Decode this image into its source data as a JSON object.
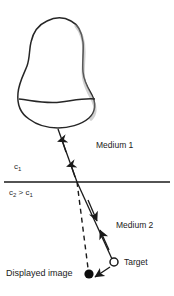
{
  "figure": {
    "background_color": "#ffffff",
    "stroke_color": "#1a1a1a",
    "width": 174,
    "height": 296
  },
  "labels": {
    "medium1": "Medium 1",
    "medium2": "Medium 2",
    "c1": "c",
    "c1_sub": "1",
    "c2_gt_c1_a": "c",
    "c2_sub": "2",
    "c2_gt_c1_op": " > c",
    "c1_sub_b": "1",
    "target": "Target",
    "displayed_image": "Displayed image"
  },
  "elements": {
    "transducer": {
      "name": "ultrasound-transducer",
      "footprint_line_y": 101
    },
    "interface": {
      "name": "medium-boundary",
      "y": 182,
      "x_start": 4,
      "x_end": 170
    },
    "target_marker": {
      "name": "target-point",
      "style": "open-circle",
      "cx": 114,
      "cy": 262,
      "r": 4
    },
    "displayed_marker": {
      "name": "displayed-image-point",
      "style": "filled-circle",
      "cx": 89,
      "cy": 274,
      "r": 4.5
    },
    "incident_ray": {
      "name": "incident-ray-medium-1",
      "description": "solid line from transducer to interface with upward arrowheads"
    },
    "refracted_ray": {
      "name": "refracted-ray-medium-2",
      "description": "solid line bending at interface down to target with arrowheads"
    },
    "apparent_path": {
      "name": "apparent-path-dashed",
      "description": "dashed straight continuation from interface to displayed image"
    },
    "displacement_arrow": {
      "name": "displacement-arrow",
      "description": "arrow from target to displayed image position"
    }
  }
}
